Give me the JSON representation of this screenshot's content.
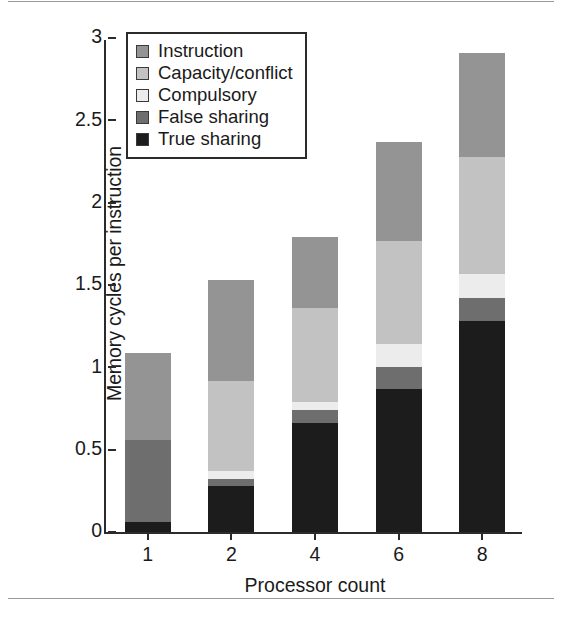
{
  "chart_data": {
    "type": "bar",
    "subtype": "stacked-bar",
    "title": "",
    "xlabel": "Processor count",
    "ylabel": "Memory cycles per instruction",
    "categories": [
      "1",
      "2",
      "4",
      "6",
      "8"
    ],
    "ylim": [
      0,
      3
    ],
    "yticks": [
      "0",
      "0.5",
      "1",
      "1.5",
      "2",
      "2.5",
      "3"
    ],
    "ytick_values": [
      0,
      0.5,
      1,
      1.5,
      2,
      2.5,
      3
    ],
    "grid": false,
    "legend_position": "top-left inside axes",
    "stack_order_bottom_to_top": [
      "True sharing",
      "False sharing",
      "Compulsory",
      "Capacity/conflict",
      "Instruction"
    ],
    "series": [
      {
        "name": "True sharing",
        "color": "#1c1c1c",
        "values": [
          0.06,
          0.28,
          0.66,
          0.87,
          1.28
        ]
      },
      {
        "name": "False sharing",
        "color": "#6e6e6e",
        "values": [
          0.5,
          0.04,
          0.08,
          0.13,
          0.14
        ]
      },
      {
        "name": "Compulsory",
        "color": "#ececec",
        "values": [
          0.0,
          0.05,
          0.05,
          0.14,
          0.15
        ]
      },
      {
        "name": "Capacity/conflict",
        "color": "#c2c2c2",
        "values": [
          0.0,
          0.55,
          0.57,
          0.63,
          0.71
        ]
      },
      {
        "name": "Instruction",
        "color": "#949494",
        "values": [
          0.53,
          0.61,
          0.43,
          0.6,
          0.63
        ]
      }
    ],
    "totals": [
      1.09,
      1.53,
      1.79,
      2.37,
      2.91
    ]
  },
  "legend": {
    "items": [
      {
        "label": "Instruction",
        "color": "#949494"
      },
      {
        "label": "Capacity/conflict",
        "color": "#c2c2c2"
      },
      {
        "label": "Compulsory",
        "color": "#ececec"
      },
      {
        "label": "False sharing",
        "color": "#6e6e6e"
      },
      {
        "label": "True sharing",
        "color": "#1c1c1c"
      }
    ]
  },
  "colors": {
    "axis": "#2b2b2b",
    "background": "#ffffff",
    "text": "#1a1a1a"
  }
}
